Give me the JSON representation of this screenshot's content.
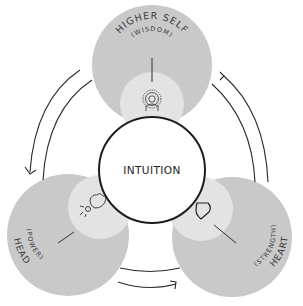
{
  "diagram": {
    "center": {
      "label": "INTUITION"
    },
    "nodes": [
      {
        "id": "higher-self",
        "title": "HIGHER SELF",
        "subtitle": "(WISDOM)",
        "icon": "person-radiating-icon"
      },
      {
        "id": "head",
        "title": "HEAD",
        "subtitle": "(POWER)",
        "icon": "hand-holding-bulb-icon"
      },
      {
        "id": "heart",
        "title": "HEART",
        "subtitle": "(STRENGTH)",
        "icon": "heart-icon"
      }
    ],
    "arrows": [
      {
        "from": "higher-self",
        "to": "head",
        "direction": "counterclockwise"
      },
      {
        "from": "head",
        "to": "heart",
        "direction": "counterclockwise"
      },
      {
        "from": "heart",
        "to": "higher-self",
        "direction": "counterclockwise"
      }
    ],
    "colors": {
      "outer_circle": "#c9c9c9",
      "inner_circle": "#e3e3e3",
      "center_fill": "#ffffff",
      "stroke": "#2b2b2b"
    }
  }
}
